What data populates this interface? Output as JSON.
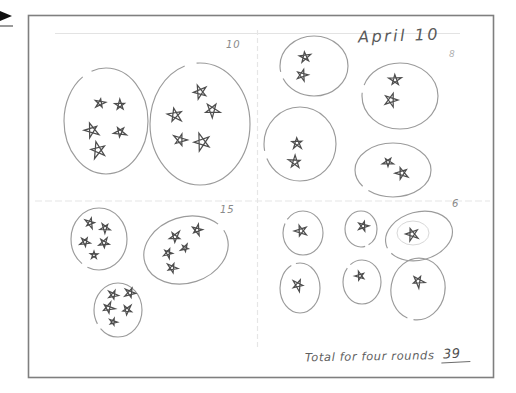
{
  "header": {
    "date_label": "April 10"
  },
  "footer": {
    "total_label": "Total for four rounds",
    "total_value": "39"
  },
  "colors": {
    "star_stroke": "#4d4d4d",
    "circle_stroke": "#9b9b9b",
    "inner_circle_stroke": "#d8d8d8",
    "page_border": "#7f7f7f",
    "fold_line": "#e3e3e3",
    "pencil_text": "#5a5a5a",
    "marker_black": "#111111",
    "marker_gray": "#9a9a9a"
  },
  "quadrants": [
    {
      "name": "round-1",
      "count_label": "10",
      "circles": [
        {
          "cx": 106,
          "cy": 121,
          "rx": 42,
          "ry": 53,
          "stars": [
            {
              "x": 100,
              "y": 103,
              "r": 5
            },
            {
              "x": 120,
              "y": 105,
              "r": 5
            },
            {
              "x": 92,
              "y": 130,
              "r": 7
            },
            {
              "x": 120,
              "y": 132,
              "r": 6
            },
            {
              "x": 98,
              "y": 150,
              "r": 8
            }
          ]
        },
        {
          "cx": 200,
          "cy": 124,
          "rx": 50,
          "ry": 61,
          "stars": [
            {
              "x": 200,
              "y": 92,
              "r": 7
            },
            {
              "x": 175,
              "y": 115,
              "r": 7
            },
            {
              "x": 212,
              "y": 110,
              "r": 7
            },
            {
              "x": 180,
              "y": 140,
              "r": 7
            },
            {
              "x": 202,
              "y": 142,
              "r": 8
            }
          ]
        }
      ]
    },
    {
      "name": "round-2",
      "count_label": "8",
      "circles": [
        {
          "cx": 314,
          "cy": 66,
          "rx": 34,
          "ry": 30,
          "stars": [
            {
              "x": 305,
              "y": 57,
              "r": 6
            },
            {
              "x": 302,
              "y": 75,
              "r": 6
            }
          ]
        },
        {
          "cx": 400,
          "cy": 96,
          "rx": 38,
          "ry": 33,
          "stars": [
            {
              "x": 395,
              "y": 80,
              "r": 6
            },
            {
              "x": 391,
              "y": 100,
              "r": 6
            }
          ]
        },
        {
          "cx": 300,
          "cy": 144,
          "rx": 36,
          "ry": 37,
          "stars": [
            {
              "x": 297,
              "y": 143,
              "r": 6
            },
            {
              "x": 295,
              "y": 162,
              "r": 6
            }
          ]
        },
        {
          "cx": 393,
          "cy": 170,
          "rx": 38,
          "ry": 27,
          "stars": [
            {
              "x": 388,
              "y": 162,
              "r": 5
            },
            {
              "x": 402,
              "y": 173,
              "r": 6
            }
          ]
        }
      ]
    },
    {
      "name": "round-3",
      "count_label": "15",
      "circles": [
        {
          "cx": 99,
          "cy": 239,
          "rx": 28,
          "ry": 31,
          "stars": [
            {
              "x": 90,
              "y": 223,
              "r": 5
            },
            {
              "x": 105,
              "y": 228,
              "r": 5
            },
            {
              "x": 85,
              "y": 242,
              "r": 5
            },
            {
              "x": 104,
              "y": 243,
              "r": 5
            },
            {
              "x": 94,
              "y": 255,
              "r": 4
            }
          ]
        },
        {
          "cx": 186,
          "cy": 250,
          "rx": 43,
          "ry": 33,
          "rot": -18,
          "stars": [
            {
              "x": 175,
              "y": 237,
              "r": 6
            },
            {
              "x": 197,
              "y": 230,
              "r": 5
            },
            {
              "x": 168,
              "y": 253,
              "r": 5
            },
            {
              "x": 185,
              "y": 248,
              "r": 4
            },
            {
              "x": 172,
              "y": 268,
              "r": 5
            }
          ]
        },
        {
          "cx": 118,
          "cy": 310,
          "rx": 24,
          "ry": 27,
          "stars": [
            {
              "x": 113,
              "y": 295,
              "r": 5
            },
            {
              "x": 130,
              "y": 293,
              "r": 5
            },
            {
              "x": 108,
              "y": 308,
              "r": 6
            },
            {
              "x": 127,
              "y": 310,
              "r": 5
            },
            {
              "x": 113,
              "y": 322,
              "r": 4
            }
          ]
        }
      ]
    },
    {
      "name": "round-4",
      "count_label": "6",
      "circles": [
        {
          "cx": 303,
          "cy": 233,
          "rx": 20,
          "ry": 22,
          "stars": [
            {
              "x": 301,
              "y": 231,
              "r": 6
            }
          ]
        },
        {
          "cx": 361,
          "cy": 229,
          "rx": 16,
          "ry": 18,
          "stars": [
            {
              "x": 363,
              "y": 226,
              "r": 5
            }
          ]
        },
        {
          "cx": 419,
          "cy": 236,
          "rx": 34,
          "ry": 24,
          "rot": -15,
          "inner": {
            "cx": 413,
            "cy": 233,
            "rx": 16,
            "ry": 12
          },
          "stars": [
            {
              "x": 412,
              "y": 234,
              "r": 6
            }
          ]
        },
        {
          "cx": 300,
          "cy": 288,
          "rx": 20,
          "ry": 25,
          "stars": [
            {
              "x": 298,
              "y": 285,
              "r": 6
            }
          ]
        },
        {
          "cx": 362,
          "cy": 282,
          "rx": 19,
          "ry": 22,
          "stars": [
            {
              "x": 360,
              "y": 276,
              "r": 5
            }
          ]
        },
        {
          "cx": 418,
          "cy": 289,
          "rx": 27,
          "ry": 31,
          "rot": 10,
          "stars": [
            {
              "x": 418,
              "y": 281,
              "r": 6
            }
          ]
        }
      ]
    }
  ]
}
